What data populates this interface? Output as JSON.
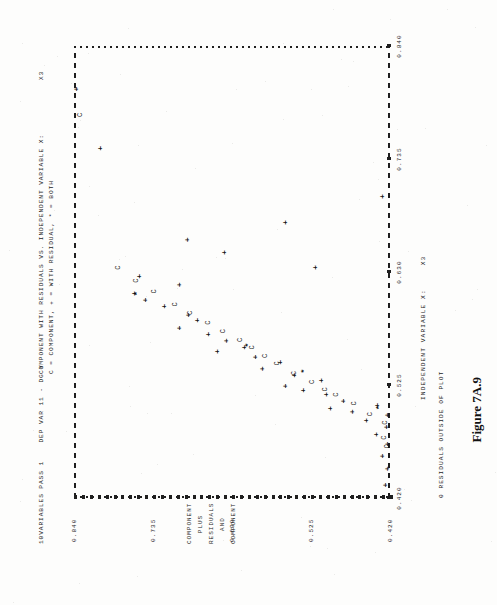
{
  "page": {
    "figure_caption": "Figure 7A.9",
    "background_color": "#fdfdfc",
    "ink_color": "#1f1f1f"
  },
  "printout": {
    "run_header": "10VARIABLES PASS 1    DEP VAR 11 - DG Y",
    "title": "COMPONENT WITH RESIDUALS VS. INDEPENDENT VARIABLE X:",
    "legend_key": "C = COMPONENT, + = WITH RESIDUAL, * = BOTH",
    "footer_note": "0 RESIDUALS OUTSIDE OF PLOT"
  },
  "axes": {
    "x_caption": "INDEPENDENT VARIABLE X:",
    "x_variable": "X3",
    "y_caption_lines": [
      "COMPONENT PLUS RESIDUALS",
      "AND",
      "COMPONENT"
    ],
    "x_ticks": [
      "0.420",
      "0.525",
      "0.630",
      "0.735",
      "0.840"
    ],
    "y_ticks": [
      "0.420",
      "0.525",
      "0.630",
      "0.735",
      "0.840"
    ],
    "top_label": "X3"
  },
  "chart_data": {
    "type": "scatter",
    "title": "COMPONENT WITH RESIDUALS VS. INDEPENDENT VARIABLE X:",
    "subtitle": "C = COMPONENT, + = WITH RESIDUAL, * = BOTH",
    "xlabel": "INDEPENDENT VARIABLE X: X3",
    "ylabel": "COMPONENT PLUS RESIDUALS AND COMPONENT",
    "xlim": [
      0.42,
      0.84
    ],
    "ylim": [
      0.42,
      0.84
    ],
    "xticks": [
      0.42,
      0.525,
      0.63,
      0.735,
      0.84
    ],
    "yticks": [
      0.42,
      0.525,
      0.63,
      0.735,
      0.84
    ],
    "grid": false,
    "legend": [
      {
        "marker": "C",
        "name": "COMPONENT"
      },
      {
        "marker": "+",
        "name": "WITH RESIDUAL"
      },
      {
        "marker": "*",
        "name": "BOTH"
      }
    ],
    "series": [
      {
        "name": "WITH RESIDUAL",
        "marker": "+",
        "points": [
          [
            0.432,
            0.427
          ],
          [
            0.447,
            0.424
          ],
          [
            0.459,
            0.431
          ],
          [
            0.47,
            0.424
          ],
          [
            0.479,
            0.438
          ],
          [
            0.486,
            0.425
          ],
          [
            0.492,
            0.452
          ],
          [
            0.497,
            0.424
          ],
          [
            0.5,
            0.47
          ],
          [
            0.503,
            0.5
          ],
          [
            0.506,
            0.437
          ],
          [
            0.51,
            0.482
          ],
          [
            0.516,
            0.505
          ],
          [
            0.52,
            0.536
          ],
          [
            0.524,
            0.56
          ],
          [
            0.529,
            0.512
          ],
          [
            0.534,
            0.548
          ],
          [
            0.54,
            0.59
          ],
          [
            0.546,
            0.566
          ],
          [
            0.551,
            0.6
          ],
          [
            0.556,
            0.65
          ],
          [
            0.56,
            0.614
          ],
          [
            0.566,
            0.638
          ],
          [
            0.572,
            0.662
          ],
          [
            0.578,
            0.7
          ],
          [
            0.585,
            0.676
          ],
          [
            0.59,
            0.688
          ],
          [
            0.598,
            0.72
          ],
          [
            0.604,
            0.745
          ],
          [
            0.61,
            0.76
          ],
          [
            0.618,
            0.7
          ],
          [
            0.626,
            0.754
          ],
          [
            0.634,
            0.52
          ],
          [
            0.648,
            0.64
          ],
          [
            0.66,
            0.69
          ],
          [
            0.676,
            0.56
          ],
          [
            0.7,
            0.43
          ],
          [
            0.745,
            0.806
          ],
          [
            0.8,
            0.838
          ]
        ]
      },
      {
        "name": "COMPONENT",
        "marker": "C",
        "points": [
          [
            0.468,
            0.424
          ],
          [
            0.476,
            0.428
          ],
          [
            0.49,
            0.427
          ],
          [
            0.498,
            0.446
          ],
          [
            0.508,
            0.468
          ],
          [
            0.516,
            0.492
          ],
          [
            0.521,
            0.506
          ],
          [
            0.528,
            0.524
          ],
          [
            0.536,
            0.548
          ],
          [
            0.545,
            0.57
          ],
          [
            0.552,
            0.586
          ],
          [
            0.56,
            0.604
          ],
          [
            0.567,
            0.62
          ],
          [
            0.575,
            0.642
          ],
          [
            0.583,
            0.662
          ],
          [
            0.592,
            0.686
          ],
          [
            0.6,
            0.706
          ],
          [
            0.612,
            0.734
          ],
          [
            0.622,
            0.758
          ],
          [
            0.634,
            0.782
          ],
          [
            0.776,
            0.832
          ]
        ]
      },
      {
        "name": "BOTH",
        "marker": "*",
        "points": [
          [
            0.504,
            0.436
          ],
          [
            0.538,
            0.536
          ],
          [
            0.562,
            0.61
          ],
          [
            0.61,
            0.758
          ]
        ]
      }
    ]
  }
}
